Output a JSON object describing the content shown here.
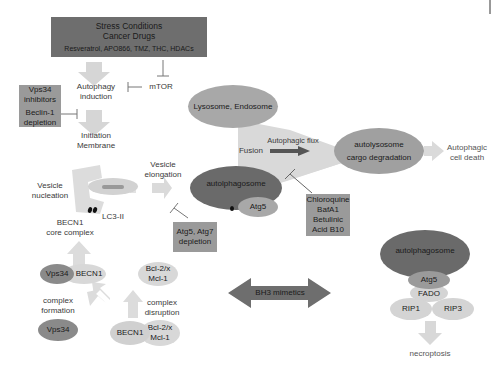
{
  "diagram": {
    "title_box": {
      "line1": "Stress Conditions",
      "line2": "Cancer Drugs",
      "line3": "Resveratrol, APO866, TMZ, THC, HDACs"
    },
    "mtor": "mTOR",
    "autophagy_induction": {
      "line1": "Autophagy",
      "line2": "induction"
    },
    "initiation_membrane": {
      "line1": "Initiation",
      "line2": "Membrane"
    },
    "vps34_inhibitors_box": {
      "line1": "Vps34",
      "line2": "inhibitors",
      "line3": "Beclin-1",
      "line4": "depletion"
    },
    "lysosome": "Lysosome, Endosome",
    "autophagic_flux": "Autophagic flux",
    "fusion": "Fusion",
    "autolysosome": {
      "line1": "autolysosome",
      "line2": "cargo degradation"
    },
    "autophagic_cell_death": {
      "line1": "Autophagic",
      "line2": "cell death"
    },
    "vesicle_nucleation": {
      "line1": "Vesicle",
      "line2": "nucleation"
    },
    "lc3": "LC3-II",
    "becn1_core": {
      "line1": "BECN1",
      "line2": "core complex"
    },
    "vesicle_elongation": {
      "line1": "Vesicle",
      "line2": "elongation"
    },
    "autophagosome_center": {
      "label": "autolphagosome",
      "atg5": "Atg5"
    },
    "atg_depletion_box": {
      "line1": "Atg5, Atg7",
      "line2": "depletion"
    },
    "inhibitors_box": {
      "line1": "Chloroquine",
      "line2": "BafA1",
      "line3": "Betulinic",
      "line4": "Acid B10"
    },
    "complex_left": {
      "vps34": "Vps34",
      "becn1": "BECN1"
    },
    "bcl_top": {
      "line1": "Bcl-2/x",
      "line2": "Mcl-1"
    },
    "complex_formation": {
      "line1": "complex",
      "line2": "formation"
    },
    "complex_disruption": {
      "line1": "complex",
      "line2": "disruption"
    },
    "vps34_single": "Vps34",
    "complex_bottom": {
      "becn1": "BECN1",
      "bcl1": "Bcl-2/x",
      "bcl2": "Mcl-1"
    },
    "bh3_mimetics": "BH3 mimetics",
    "necroptosis_panel": {
      "autophagosome": "autolphagosome",
      "atg5": "Atg5",
      "fado": "FADO",
      "rip1": "RIP1",
      "rip3": "RIP3",
      "necroptosis": "necroptosis"
    },
    "colors": {
      "dark_box": "#6e6e6e",
      "mid_box": "#9a9a9a",
      "light_ellipse": "#a8a8a8",
      "dark_ellipse": "#6a6a6a",
      "pale": "#d8d8d8",
      "arrow": "#d4d4d4"
    }
  }
}
